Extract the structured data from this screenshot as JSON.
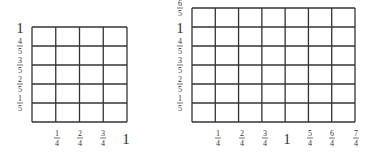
{
  "diagrams": [
    {
      "name": "left-grid",
      "cols": 4,
      "rows": 5,
      "box": {
        "x": 32,
        "y": 27,
        "w": 95,
        "h": 95
      },
      "x_labels": [
        {
          "num": "1",
          "den": "4",
          "x": 57
        },
        {
          "num": "2",
          "den": "4",
          "x": 80
        },
        {
          "num": "3",
          "den": "4",
          "x": 103
        },
        {
          "whole": "1",
          "x": 126
        }
      ],
      "y_labels": [
        {
          "whole": "1",
          "y": 27
        },
        {
          "num": "4",
          "den": "5",
          "y": 46
        },
        {
          "num": "3",
          "den": "5",
          "y": 65
        },
        {
          "num": "2",
          "den": "5",
          "y": 84
        },
        {
          "num": "1",
          "den": "5",
          "y": 103
        }
      ],
      "y_label_x": 20
    },
    {
      "name": "right-grid",
      "cols": 7,
      "rows": 6,
      "box": {
        "x": 192,
        "y": 8,
        "w": 163,
        "h": 114
      },
      "x_labels": [
        {
          "num": "1",
          "den": "4",
          "x": 218
        },
        {
          "num": "2",
          "den": "4",
          "x": 242
        },
        {
          "num": "3",
          "den": "4",
          "x": 265
        },
        {
          "whole": "1",
          "x": 287
        },
        {
          "num": "5",
          "den": "4",
          "x": 310
        },
        {
          "num": "6",
          "den": "4",
          "x": 332
        },
        {
          "num": "7",
          "den": "4",
          "x": 356
        }
      ],
      "y_labels": [
        {
          "num": "6",
          "den": "5",
          "y": 8
        },
        {
          "whole": "1",
          "y": 27
        },
        {
          "num": "4",
          "den": "5",
          "y": 46
        },
        {
          "num": "3",
          "den": "5",
          "y": 65
        },
        {
          "num": "2",
          "den": "5",
          "y": 84
        },
        {
          "num": "1",
          "den": "5",
          "y": 103
        }
      ],
      "y_label_x": 180
    }
  ],
  "x_label_y": 138,
  "colors": {
    "grid": "#333333",
    "text": "#333333",
    "background": "#ffffff"
  }
}
